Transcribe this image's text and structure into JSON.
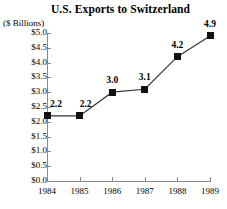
{
  "chart_data": {
    "type": "line",
    "title": "U.S. Exports to Switzerland",
    "ylabel": "($ Billions)",
    "xlabel": "",
    "categories": [
      "1984",
      "1985",
      "1986",
      "1987",
      "1988",
      "1989"
    ],
    "values": [
      2.2,
      2.2,
      3.0,
      3.1,
      4.2,
      4.9
    ],
    "point_labels": [
      "2.2",
      "2.2",
      "3.0",
      "3.1",
      "4.2",
      "4.9"
    ],
    "ylim": [
      0.0,
      5.0
    ],
    "ytick_values": [
      0.0,
      0.5,
      1.0,
      1.5,
      2.0,
      2.5,
      3.0,
      3.5,
      4.0,
      4.5,
      5.0
    ],
    "ytick_labels": [
      "$0.0",
      "$0.5",
      "$1.0",
      "$1.5",
      "$2.0",
      "$2.5",
      "$3.0",
      "$3.5",
      "$4.0",
      "$4.5",
      "$5.0"
    ],
    "grid": false,
    "legend": false,
    "marker": "square",
    "marker_color": "#111111",
    "line_color": "#333333",
    "axis_color": "#8a8a8a",
    "background_color": "#ffffff"
  }
}
